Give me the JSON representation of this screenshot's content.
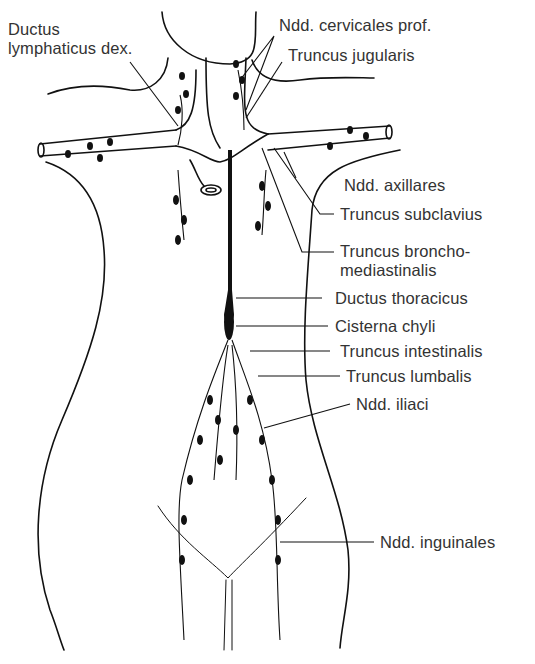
{
  "diagram": {
    "labels": [
      {
        "id": "ductus_lymphaticus_dex",
        "text_line1": "Ductus",
        "text_line2": "lymphaticus dex."
      },
      {
        "id": "ndd_cervicales_prof",
        "text": "Ndd. cervicales prof."
      },
      {
        "id": "truncus_jugularis",
        "text": "Truncus jugularis"
      },
      {
        "id": "ndd_axillares",
        "text": "Ndd. axillares"
      },
      {
        "id": "truncus_subclavius",
        "text": "Truncus subclavius"
      },
      {
        "id": "truncus_bronchomediastinalis",
        "text_line1": "Truncus broncho-",
        "text_line2": "mediastinalis"
      },
      {
        "id": "ductus_thoracicus",
        "text": "Ductus thoracicus"
      },
      {
        "id": "cisterna_chyli",
        "text": "Cisterna chyli"
      },
      {
        "id": "truncus_intestinalis",
        "text": "Truncus intestinalis"
      },
      {
        "id": "truncus_lumbalis",
        "text": "Truncus lumbalis"
      },
      {
        "id": "ndd_iliaci",
        "text": "Ndd. iliaci"
      },
      {
        "id": "ndd_inguinales",
        "text": "Ndd. inguinales"
      }
    ],
    "colors": {
      "line": "#111111",
      "text": "#333333",
      "background": "#ffffff"
    }
  }
}
